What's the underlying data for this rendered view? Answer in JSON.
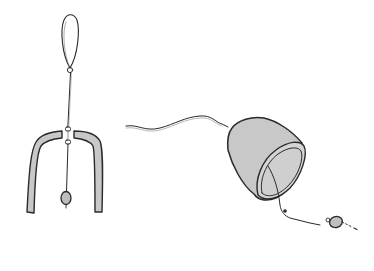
{
  "illustration": {
    "background": "#ffffff",
    "stroke_color": "#2a2a2a",
    "fill_color": "#c8c8c8",
    "rim_fill": "#d6d6d6",
    "figures": [
      {
        "id": "hanging-wind-chime",
        "parts": [
          "hanging-loop",
          "cord",
          "clapper-weight",
          "bell-body-cross-section"
        ]
      },
      {
        "id": "tilted-bell-with-clapper",
        "parts": [
          "cord",
          "bell-body",
          "bell-rim",
          "clapper-cord",
          "clapper-weight"
        ]
      }
    ]
  }
}
